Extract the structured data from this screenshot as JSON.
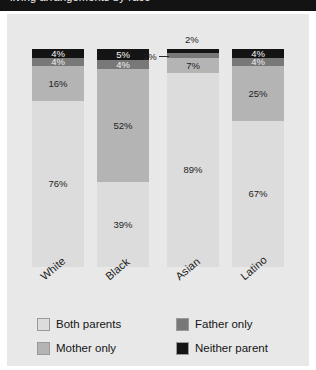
{
  "header": {
    "band_text": "living arrangements by race"
  },
  "chart_data": {
    "type": "bar",
    "stacked": true,
    "title": "",
    "subtitle": "",
    "xlabel": "",
    "ylabel": "",
    "ylim": [
      0,
      100
    ],
    "grid": false,
    "legend_position": "bottom",
    "value_suffix": "%",
    "categories": [
      "White",
      "Black",
      "Asian",
      "Latino"
    ],
    "series": [
      {
        "name": "Both parents",
        "color": "#dcdcdc",
        "values": [
          76,
          39,
          89,
          67
        ],
        "labels": [
          "76%",
          "39%",
          "89%",
          "67%"
        ]
      },
      {
        "name": "Mother only",
        "color": "#b4b4b4",
        "values": [
          16,
          52,
          7,
          25
        ],
        "labels": [
          "16%",
          "52%",
          "7%",
          "25%"
        ]
      },
      {
        "name": "Father only",
        "color": "#787878",
        "values": [
          4,
          4,
          2,
          4
        ],
        "labels": [
          "4%",
          "4%",
          "2%",
          "4%"
        ],
        "label_outside": [
          false,
          false,
          true,
          false
        ]
      },
      {
        "name": "Neither parent",
        "color": "#141414",
        "values": [
          4,
          5,
          2,
          4
        ],
        "labels": [
          "4%",
          "5%",
          "2%",
          "4%"
        ],
        "label_outside": [
          false,
          false,
          true,
          false
        ]
      }
    ],
    "annotations": [
      {
        "text": "2%",
        "for": "Asian / Neither parent",
        "placement": "above-bar"
      },
      {
        "text": "2%",
        "for": "Asian / Father only",
        "placement": "left-with-leader-line"
      }
    ]
  },
  "legend": {
    "items": [
      {
        "label": "Both parents",
        "color": "#dcdcdc"
      },
      {
        "label": "Mother only",
        "color": "#b4b4b4"
      },
      {
        "label": "Father only",
        "color": "#787878"
      },
      {
        "label": "Neither parent",
        "color": "#141414"
      }
    ]
  }
}
